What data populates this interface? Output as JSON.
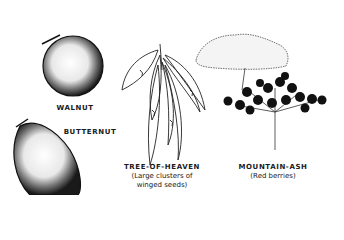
{
  "illustrations": [
    {
      "name": "WALNUT",
      "caption": ""
    },
    {
      "name": "BUTTERNUT",
      "caption": ""
    },
    {
      "name": "TREE-OF-HEAVEN",
      "caption_lines": [
        "(Large clusters of",
        "winged seeds)"
      ]
    },
    {
      "name": "MOUNTAIN-ASH",
      "caption_lines": [
        "(Red berries)"
      ]
    }
  ]
}
